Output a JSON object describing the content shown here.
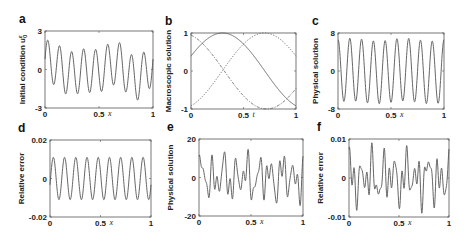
{
  "chart_data": [
    {
      "id": "a",
      "type": "line",
      "panel_label": "a",
      "title": "",
      "xlabel": "x",
      "ylabel": "Initial condition u",
      "ylabel_sup": "ε",
      "ylabel_sub": "0",
      "xlim": [
        0,
        1
      ],
      "ylim": [
        -3,
        3
      ],
      "xticks": [
        "0",
        "0.5",
        "1"
      ],
      "yticks": [
        "-3",
        "0",
        "3"
      ],
      "grid": false,
      "box": {
        "left": 45,
        "top": 31,
        "right": 153,
        "bottom": 108
      },
      "series": [
        {
          "name": "u0",
          "style": "solid",
          "generator": "multi_sine",
          "components": [
            [
              1.7,
              9,
              0.2
            ],
            [
              0.4,
              2,
              0.5
            ],
            [
              0.3,
              3,
              1.2
            ]
          ],
          "description": "oscillation with ~9 periods, amplitude 1.5-2.4"
        }
      ]
    },
    {
      "id": "b",
      "type": "line",
      "panel_label": "b",
      "title": "",
      "xlabel": "t",
      "ylabel": "Macroscopic solution",
      "xlim": [
        0,
        1
      ],
      "ylim": [
        -1,
        1
      ],
      "xticks": [
        "0",
        "0.5",
        "1"
      ],
      "yticks": [
        "-1",
        "0",
        "1"
      ],
      "grid": false,
      "box": {
        "left": 191,
        "top": 33,
        "right": 296,
        "bottom": 109
      },
      "series": [
        {
          "name": "solid",
          "style": "solid",
          "generator": "cos",
          "amp": 1,
          "omega": 3.9,
          "center": 0.3
        },
        {
          "name": "dotted",
          "style": "dotted",
          "generator": "cos",
          "amp": 1,
          "omega": 3.9,
          "center": 0.7
        },
        {
          "name": "dashdot",
          "style": "dashdot",
          "generator": "cos",
          "amp": -1,
          "omega": 3.9,
          "center": 0.72
        }
      ]
    },
    {
      "id": "c",
      "type": "line",
      "panel_label": "c",
      "title": "",
      "xlabel": "x",
      "ylabel": "Physical solution",
      "xlim": [
        0,
        1
      ],
      "ylim": [
        -8,
        8
      ],
      "xticks": [
        "0",
        "0.5",
        "1"
      ],
      "yticks": [
        "-8",
        "0",
        "8"
      ],
      "grid": false,
      "box": {
        "left": 338,
        "top": 33,
        "right": 444,
        "bottom": 109
      },
      "series": [
        {
          "name": "u",
          "style": "solid",
          "generator": "multi_sine",
          "components": [
            [
              6.6,
              9,
              1.55
            ],
            [
              0.3,
              2,
              0.0
            ]
          ],
          "description": "regular oscillation ~9 periods, amplitude ~6.5"
        }
      ]
    },
    {
      "id": "d",
      "type": "line",
      "panel_label": "d",
      "title": "",
      "xlabel": "x",
      "ylabel": "Relative error",
      "xlim": [
        0,
        1
      ],
      "ylim": [
        -0.02,
        0.02
      ],
      "xticks": [
        "0",
        "0.5",
        "1"
      ],
      "yticks": [
        "-0.02",
        "0",
        "0.02"
      ],
      "grid": false,
      "box": {
        "left": 50,
        "top": 140,
        "right": 151,
        "bottom": 217
      },
      "series": [
        {
          "name": "err",
          "style": "solid",
          "generator": "multi_sine",
          "components": [
            [
              0.011,
              9,
              -0.3
            ]
          ],
          "description": "regular oscillation ~9 periods, amplitude ~0.011"
        }
      ]
    },
    {
      "id": "e",
      "type": "line",
      "panel_label": "e",
      "title": "",
      "xlabel": "x",
      "ylabel": "Physical solution",
      "xlim": [
        0,
        1
      ],
      "ylim": [
        -20,
        20
      ],
      "xticks": [
        "0",
        "0.5",
        "1"
      ],
      "yticks": [
        "-20",
        "0",
        "20"
      ],
      "grid": false,
      "box": {
        "left": 199,
        "top": 139,
        "right": 303,
        "bottom": 216
      },
      "series": [
        {
          "name": "u",
          "style": "solid",
          "generator": "multi_sine",
          "components": [
            [
              7,
              9,
              0.4
            ],
            [
              5,
              17,
              1.1
            ],
            [
              3,
              23,
              2.3
            ],
            [
              2.5,
              5,
              0.7
            ]
          ],
          "description": "irregular multi-frequency oscillation, range about -18 to 18"
        }
      ]
    },
    {
      "id": "f",
      "type": "line",
      "panel_label": "f",
      "title": "",
      "xlabel": "x",
      "ylabel": "Relative error",
      "xlim": [
        0,
        1
      ],
      "ylim": [
        -0.01,
        0.01
      ],
      "xticks": [
        "0",
        "0.5",
        "1"
      ],
      "yticks": [
        "-0.01",
        "0",
        "0.01"
      ],
      "grid": false,
      "box": {
        "left": 349,
        "top": 139,
        "right": 449,
        "bottom": 217
      },
      "series": [
        {
          "name": "err",
          "style": "solid",
          "generator": "multi_sine",
          "components": [
            [
              0.0035,
              9,
              0.9
            ],
            [
              0.003,
              17,
              2.1
            ],
            [
              0.002,
              23,
              0.3
            ],
            [
              0.0015,
              5,
              1.6
            ]
          ],
          "description": "irregular oscillation, range about -0.009 to 0.009"
        }
      ]
    }
  ]
}
